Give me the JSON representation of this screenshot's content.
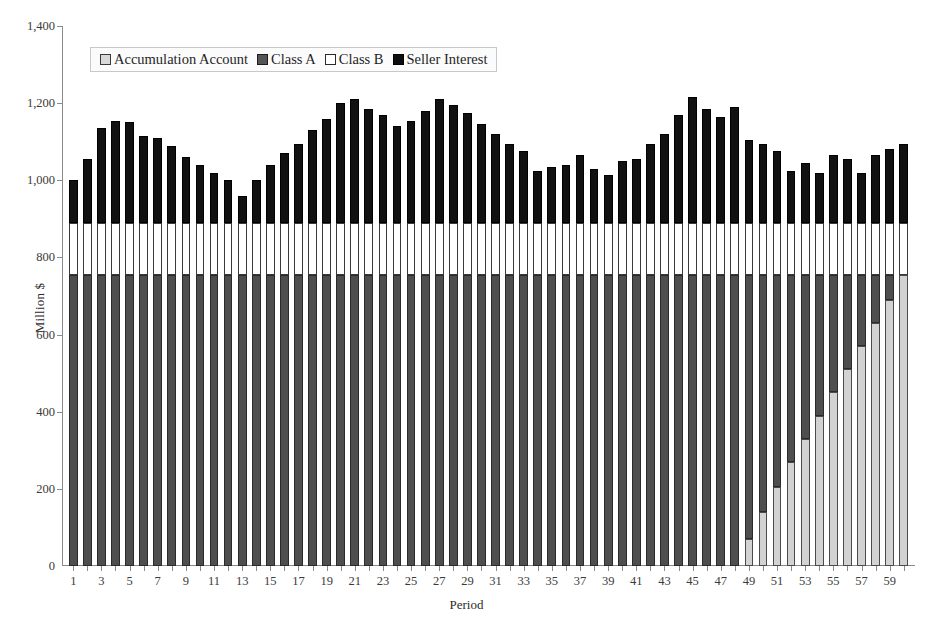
{
  "chart_data": {
    "type": "bar",
    "subtype": "stacked-column",
    "title": "",
    "xlabel": "Period",
    "ylabel": "Million $",
    "ylim": [
      0,
      1400
    ],
    "ytick_labels": [
      "0",
      "200",
      "400",
      "600",
      "800",
      "1,000",
      "1,200",
      "1,400"
    ],
    "ytick_values": [
      0,
      200,
      400,
      600,
      800,
      1000,
      1200,
      1400
    ],
    "grid": false,
    "legend_position": "top-left-inside",
    "x": [
      1,
      2,
      3,
      4,
      5,
      6,
      7,
      8,
      9,
      10,
      11,
      12,
      13,
      14,
      15,
      16,
      17,
      18,
      19,
      20,
      21,
      22,
      23,
      24,
      25,
      26,
      27,
      28,
      29,
      30,
      31,
      32,
      33,
      34,
      35,
      36,
      37,
      38,
      39,
      40,
      41,
      42,
      43,
      44,
      45,
      46,
      47,
      48,
      49,
      50,
      51,
      52,
      53,
      54,
      55,
      56,
      57,
      58,
      59,
      60
    ],
    "xtick_labels": [
      "1",
      "3",
      "5",
      "7",
      "9",
      "11",
      "13",
      "15",
      "17",
      "19",
      "21",
      "23",
      "25",
      "27",
      "29",
      "31",
      "33",
      "35",
      "37",
      "39",
      "41",
      "43",
      "45",
      "47",
      "49",
      "51",
      "53",
      "55",
      "57",
      "59"
    ],
    "series": [
      {
        "name": "Accumulation Account",
        "color": "#d2d2d2",
        "values": [
          0,
          0,
          0,
          0,
          0,
          0,
          0,
          0,
          0,
          0,
          0,
          0,
          0,
          0,
          0,
          0,
          0,
          0,
          0,
          0,
          0,
          0,
          0,
          0,
          0,
          0,
          0,
          0,
          0,
          0,
          0,
          0,
          0,
          0,
          0,
          0,
          0,
          0,
          0,
          0,
          0,
          0,
          0,
          0,
          0,
          0,
          0,
          0,
          70,
          140,
          205,
          270,
          330,
          390,
          450,
          510,
          570,
          630,
          690,
          755
        ]
      },
      {
        "name": "Class A",
        "color": "#4e4e4e",
        "values": [
          755,
          755,
          755,
          755,
          755,
          755,
          755,
          755,
          755,
          755,
          755,
          755,
          755,
          755,
          755,
          755,
          755,
          755,
          755,
          755,
          755,
          755,
          755,
          755,
          755,
          755,
          755,
          755,
          755,
          755,
          755,
          755,
          755,
          755,
          755,
          755,
          755,
          755,
          755,
          755,
          755,
          755,
          755,
          755,
          755,
          755,
          755,
          755,
          685,
          615,
          550,
          485,
          425,
          365,
          305,
          245,
          185,
          125,
          65,
          0
        ]
      },
      {
        "name": "Class B",
        "color": "#ffffff",
        "values": [
          135,
          135,
          135,
          135,
          135,
          135,
          135,
          135,
          135,
          135,
          135,
          135,
          135,
          135,
          135,
          135,
          135,
          135,
          135,
          135,
          135,
          135,
          135,
          135,
          135,
          135,
          135,
          135,
          135,
          135,
          135,
          135,
          135,
          135,
          135,
          135,
          135,
          135,
          135,
          135,
          135,
          135,
          135,
          135,
          135,
          135,
          135,
          135,
          135,
          135,
          135,
          135,
          135,
          135,
          135,
          135,
          135,
          135,
          135,
          135
        ]
      },
      {
        "name": "Seller Interest",
        "color": "#111111",
        "values": [
          110,
          165,
          245,
          265,
          260,
          225,
          220,
          200,
          170,
          150,
          130,
          110,
          70,
          110,
          150,
          180,
          205,
          240,
          270,
          310,
          320,
          295,
          280,
          250,
          265,
          290,
          320,
          305,
          285,
          255,
          230,
          205,
          185,
          135,
          145,
          150,
          175,
          140,
          125,
          160,
          165,
          205,
          230,
          280,
          325,
          295,
          275,
          300,
          215,
          205,
          185,
          135,
          155,
          130,
          175,
          165,
          130,
          175,
          190,
          205
        ]
      }
    ],
    "totals": [
      1000,
      1055,
      1135,
      1155,
      1150,
      1115,
      1110,
      1090,
      1060,
      1040,
      1020,
      1000,
      960,
      1000,
      1040,
      1070,
      1095,
      1130,
      1160,
      1200,
      1210,
      1185,
      1170,
      1140,
      1155,
      1180,
      1210,
      1195,
      1175,
      1145,
      1120,
      1095,
      1075,
      1025,
      1035,
      1040,
      1065,
      1030,
      1015,
      1050,
      1055,
      1095,
      1120,
      1170,
      1215,
      1185,
      1165,
      1190,
      1105,
      1095,
      1075,
      1025,
      1045,
      1020,
      1065,
      1055,
      1020,
      1065,
      1080,
      1090
    ]
  },
  "legend": {
    "items": [
      {
        "label": "Accumulation Account",
        "swatch": "acc"
      },
      {
        "label": "Class A",
        "swatch": "a"
      },
      {
        "label": "Class B",
        "swatch": "b"
      },
      {
        "label": "Seller Interest",
        "swatch": "s"
      }
    ]
  },
  "colors": {
    "accumulation_account": "#d2d2d2",
    "class_a": "#4e4e4e",
    "class_b": "#ffffff",
    "seller_interest": "#111111",
    "axis": "#8a8a8a",
    "background": "#ffffff"
  }
}
